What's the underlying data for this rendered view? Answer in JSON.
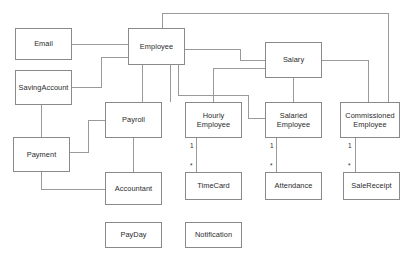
{
  "diagram": {
    "type": "uml-class-diagram",
    "canvas": {
      "width": 412,
      "height": 265
    },
    "style": {
      "background": "#ffffff",
      "box_fill": "#ffffff",
      "box_border": "#8a8a8a",
      "edge_color": "#9a9a9a",
      "text_color": "#2b2b2b"
    },
    "classes": [
      {
        "id": "email",
        "name": "Email",
        "x": 15,
        "y": 28,
        "w": 57,
        "h": 32
      },
      {
        "id": "employee",
        "name": "Employee",
        "x": 128,
        "y": 28,
        "w": 57,
        "h": 37
      },
      {
        "id": "salary",
        "name": "Salary",
        "x": 265,
        "y": 42,
        "w": 57,
        "h": 36
      },
      {
        "id": "savings",
        "name": "SavingAccount",
        "x": 15,
        "y": 70,
        "w": 57,
        "h": 35
      },
      {
        "id": "payroll",
        "name": "Payroll",
        "x": 105,
        "y": 102,
        "w": 57,
        "h": 36
      },
      {
        "id": "hourly",
        "name": "Hourly\nEmployee",
        "x": 185,
        "y": 102,
        "w": 57,
        "h": 36
      },
      {
        "id": "salaried",
        "name": "Salaried\nEmployee",
        "x": 265,
        "y": 102,
        "w": 57,
        "h": 36
      },
      {
        "id": "commissioned",
        "name": "Commissioned\nEmployee",
        "x": 340,
        "y": 102,
        "w": 60,
        "h": 36
      },
      {
        "id": "payment",
        "name": "Payment",
        "x": 13,
        "y": 137,
        "w": 57,
        "h": 35
      },
      {
        "id": "accountant",
        "name": "Accountant",
        "x": 105,
        "y": 172,
        "w": 57,
        "h": 33
      },
      {
        "id": "timecard",
        "name": "TimeCard",
        "x": 185,
        "y": 172,
        "w": 57,
        "h": 28
      },
      {
        "id": "attendance",
        "name": "Attendance",
        "x": 265,
        "y": 172,
        "w": 57,
        "h": 28
      },
      {
        "id": "salereceipt",
        "name": "SaleReceipt",
        "x": 343,
        "y": 172,
        "w": 57,
        "h": 28
      },
      {
        "id": "payday",
        "name": "PayDay",
        "x": 105,
        "y": 222,
        "w": 57,
        "h": 26
      },
      {
        "id": "notification",
        "name": "Notification",
        "x": 185,
        "y": 222,
        "w": 57,
        "h": 26
      }
    ],
    "multiplicities": [
      {
        "id": "hourly-timecard-one",
        "text": "1",
        "x": 190,
        "y": 143
      },
      {
        "id": "hourly-timecard-many",
        "text": "*",
        "x": 190,
        "y": 163
      },
      {
        "id": "salaried-attendance-one",
        "text": "1",
        "x": 270,
        "y": 143
      },
      {
        "id": "salaried-attendance-many",
        "text": "*",
        "x": 270,
        "y": 163
      },
      {
        "id": "commissioned-receipt-one",
        "text": "1",
        "x": 348,
        "y": 143
      },
      {
        "id": "commissioned-receipt-many",
        "text": "*",
        "x": 348,
        "y": 163
      }
    ],
    "edges": [
      {
        "id": "email-employee",
        "from": "email",
        "to": "employee",
        "path": "M 72 44 L 128 44"
      },
      {
        "id": "savings-employee",
        "from": "savings",
        "to": "employee",
        "path": "M 72 87 L 101 87 L 101 57 L 128 57"
      },
      {
        "id": "employee-payroll",
        "from": "employee",
        "to": "payroll",
        "path": "M 142 65 L 142 102"
      },
      {
        "id": "employee-hourly",
        "from": "employee",
        "to": "hourly",
        "path": "M 170 65 L 170 102"
      },
      {
        "id": "employee-salaried",
        "from": "employee",
        "to": "salaried",
        "path": "M 178 65 L 178 95 L 248 95 L 248 118 L 265 118"
      },
      {
        "id": "employee-salary",
        "from": "employee",
        "to": "salary",
        "path": "M 185 49 L 240 49 L 240 60 L 265 60"
      },
      {
        "id": "employee-commissioned",
        "from": "employee",
        "to": "commissioned",
        "path": "M 162 28 L 162 13 L 388 13 L 388 102"
      },
      {
        "id": "salary-salaried",
        "from": "salary",
        "to": "salaried",
        "path": "M 293 78 L 293 102"
      },
      {
        "id": "salary-commissioned",
        "from": "salary",
        "to": "commissioned",
        "path": "M 322 60 L 368 60 L 368 102"
      },
      {
        "id": "salary-hourly",
        "from": "salary",
        "to": "hourly",
        "path": "M 265 68 L 213 68 L 213 102"
      },
      {
        "id": "savings-payment",
        "from": "savings",
        "to": "payment",
        "path": "M 41 105 L 41 137"
      },
      {
        "id": "payment-payroll",
        "from": "payment",
        "to": "payroll",
        "path": "M 70 152 L 88 152 L 88 120 L 105 120"
      },
      {
        "id": "payment-accountant",
        "from": "payment",
        "to": "accountant",
        "path": "M 41 172 L 41 189 L 105 189"
      },
      {
        "id": "payroll-accountant",
        "from": "payroll",
        "to": "accountant",
        "path": "M 133 138 L 133 172"
      },
      {
        "id": "hourly-timecard",
        "from": "hourly",
        "to": "timecard",
        "path": "M 196 138 L 196 172"
      },
      {
        "id": "salaried-attendance",
        "from": "salaried",
        "to": "attendance",
        "path": "M 276 138 L 276 172"
      },
      {
        "id": "commissioned-salereceipt",
        "from": "commissioned",
        "to": "salereceipt",
        "path": "M 355 138 L 355 172"
      }
    ]
  }
}
